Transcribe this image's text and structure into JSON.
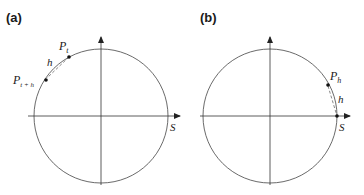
{
  "panels": [
    {
      "label": "(a)",
      "points": [
        {
          "name": "P",
          "sub": "t"
        },
        {
          "name": "P",
          "sub": "t + h"
        }
      ],
      "arc_label": "h",
      "axis_label": "S"
    },
    {
      "label": "(b)",
      "points": [
        {
          "name": "P",
          "sub": "h"
        }
      ],
      "arc_label": "h",
      "axis_label": "S"
    }
  ],
  "colors": {
    "line": "#333333",
    "text": "#1a1a1a"
  }
}
